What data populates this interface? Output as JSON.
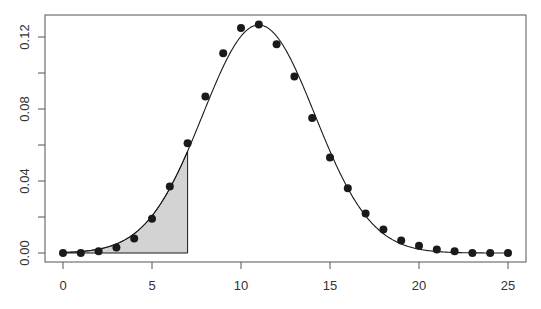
{
  "chart_data": {
    "type": "scatter",
    "title": "",
    "xlabel": "",
    "ylabel": "",
    "xlim": [
      0,
      25
    ],
    "ylim": [
      0,
      0.13
    ],
    "grid": false,
    "x_ticks": [
      0,
      5,
      10,
      15,
      20,
      25
    ],
    "x_tick_labels": [
      "0",
      "5",
      "10",
      "15",
      "20",
      "25"
    ],
    "y_ticks": [
      0.0,
      0.04,
      0.08,
      0.12
    ],
    "y_tick_labels": [
      "0.00",
      "0.04",
      "0.08",
      "0.12"
    ],
    "y_minor_ticks": [
      0.02,
      0.06,
      0.1
    ],
    "series": [
      {
        "name": "probability points",
        "type": "scatter",
        "x": [
          0,
          1,
          2,
          3,
          4,
          5,
          6,
          7,
          8,
          9,
          10,
          11,
          12,
          13,
          14,
          15,
          16,
          17,
          18,
          19,
          20,
          21,
          22,
          23,
          24,
          25
        ],
        "values": [
          0.0,
          0.0,
          0.001,
          0.003,
          0.008,
          0.019,
          0.037,
          0.061,
          0.087,
          0.111,
          0.125,
          0.127,
          0.116,
          0.098,
          0.075,
          0.053,
          0.036,
          0.022,
          0.013,
          0.007,
          0.004,
          0.002,
          0.001,
          0.0,
          0.0,
          0.0
        ]
      },
      {
        "name": "normal approximation curve",
        "type": "line",
        "mean": 11,
        "sd": 3.15
      }
    ],
    "shaded_region": {
      "from": 0,
      "to": 7,
      "under": "normal approximation curve",
      "color": "#d3d3d3"
    },
    "colors": {
      "points": "#1a1a1a",
      "curve": "#1a1a1a",
      "axis": "#555555",
      "shade": "#d3d3d3"
    }
  }
}
